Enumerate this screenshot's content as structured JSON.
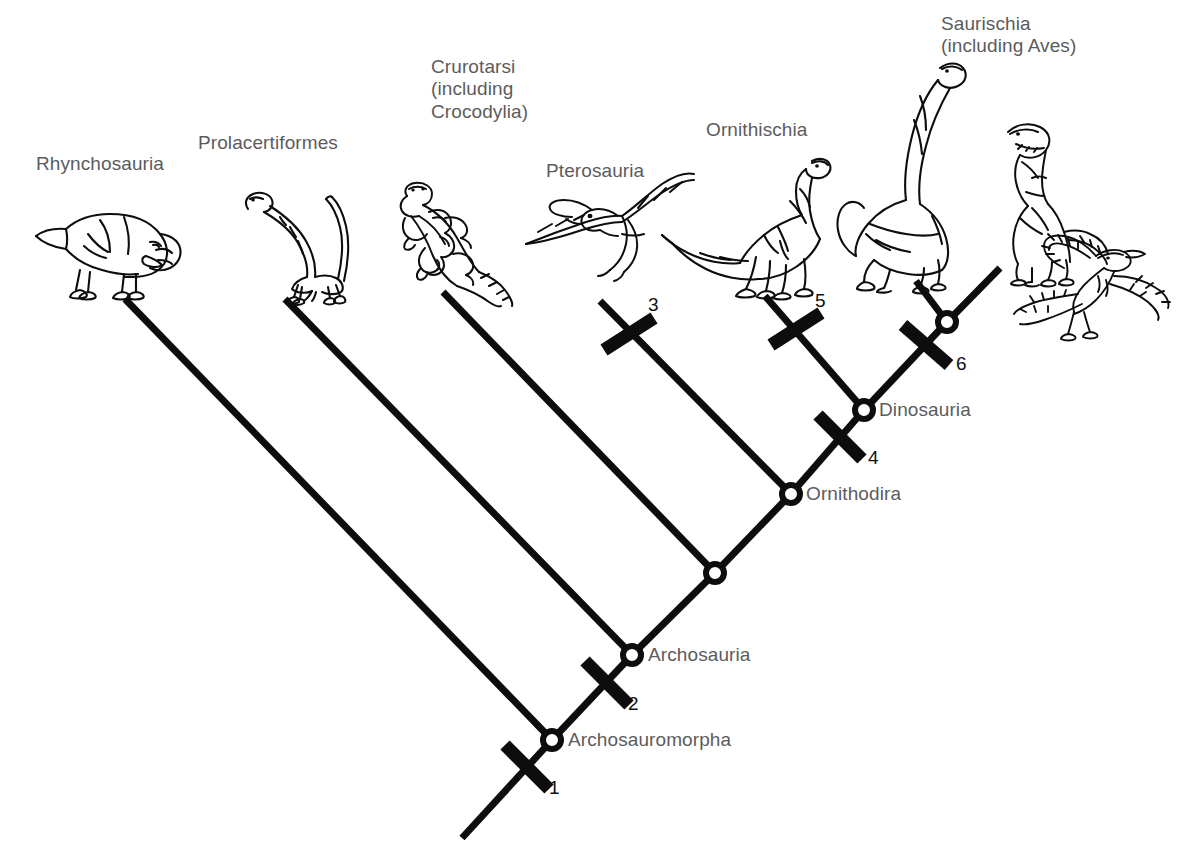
{
  "figure": {
    "background_color": "#ffffff",
    "line_color": "#0d0d0d",
    "label_color": "#5c5c5c",
    "number_color": "#111111",
    "width": 1199,
    "height": 861
  },
  "taxa": [
    {
      "id": "rhynchosauria",
      "label": "Rhynchosauria",
      "x": 36,
      "y": 162,
      "tip_x": 125,
      "tip_y": 299,
      "icon": "rhynchosaur-illustration"
    },
    {
      "id": "prolacertiformes",
      "label": "Prolacertiformes",
      "x": 198,
      "y": 141,
      "tip_x": 285,
      "tip_y": 299,
      "icon": "prolacertiform-illustration"
    },
    {
      "id": "crurotarsi",
      "label": "Crurotarsi\n(including\nCrocodylia)",
      "x": 431,
      "y": 65,
      "tip_x": 443,
      "tip_y": 292,
      "icon": "crocodylian-illustration"
    },
    {
      "id": "pterosauria",
      "label": "Pterosauria",
      "x": 546,
      "y": 169,
      "tip_x": 600,
      "tip_y": 301,
      "icon": "pterosaur-illustration"
    },
    {
      "id": "ornithischia",
      "label": "Ornithischia",
      "x": 706,
      "y": 128,
      "tip_x": 765,
      "tip_y": 296,
      "icon": "ornithischian-illustration"
    },
    {
      "id": "saurischia",
      "label": "Saurischia\n(including Aves)",
      "x": 941,
      "y": 22,
      "tip_x": 916,
      "tip_y": 281,
      "icon": "sauropod-and-theropod-illustration"
    }
  ],
  "nodes": [
    {
      "id": "archosauromorpha",
      "label": "Archosauromorpha",
      "x": 552,
      "y": 740,
      "label_x": 568,
      "label_y": 729
    },
    {
      "id": "archosauria",
      "label": "Archosauria",
      "x": 632,
      "y": 655,
      "label_x": 648,
      "label_y": 644
    },
    {
      "id": "unnamed-ornithodira-parent",
      "label": "",
      "x": 715,
      "y": 573,
      "label_x": 0,
      "label_y": 0
    },
    {
      "id": "ornithodira",
      "label": "Ornithodira",
      "x": 791,
      "y": 494,
      "label_x": 806,
      "label_y": 483
    },
    {
      "id": "dinosauria",
      "label": "Dinosauria",
      "x": 864,
      "y": 410,
      "label_x": 879,
      "label_y": 399
    },
    {
      "id": "saurischia-node",
      "label": "",
      "x": 947,
      "y": 322,
      "label_x": 0,
      "label_y": 0
    }
  ],
  "synapomorphies": [
    {
      "number": "1",
      "bar_x": 527,
      "bar_y": 765,
      "label_x": 549,
      "label_y": 777,
      "on_branch": "root-to-archosauromorpha"
    },
    {
      "number": "2",
      "bar_x": 607,
      "bar_y": 681,
      "label_x": 628,
      "label_y": 693,
      "on_branch": "archosauromorpha-to-archosauria"
    },
    {
      "number": "3",
      "bar_x": 628,
      "bar_y": 335,
      "label_x": 648,
      "label_y": 294,
      "on_branch": "pterosauria-branch"
    },
    {
      "number": "4",
      "bar_x": 840,
      "bar_y": 435,
      "label_x": 868,
      "label_y": 447,
      "on_branch": "ornithodira-to-dinosauria"
    },
    {
      "number": "5",
      "bar_x": 795,
      "bar_y": 330,
      "label_x": 815,
      "label_y": 290,
      "on_branch": "ornithischia-branch"
    },
    {
      "number": "6",
      "bar_x": 925,
      "bar_y": 345,
      "label_x": 956,
      "label_y": 353,
      "on_branch": "dinosauria-to-saurischia"
    }
  ],
  "root": {
    "from_x": 462,
    "from_y": 838,
    "to_x": 552,
    "to_y": 740
  }
}
